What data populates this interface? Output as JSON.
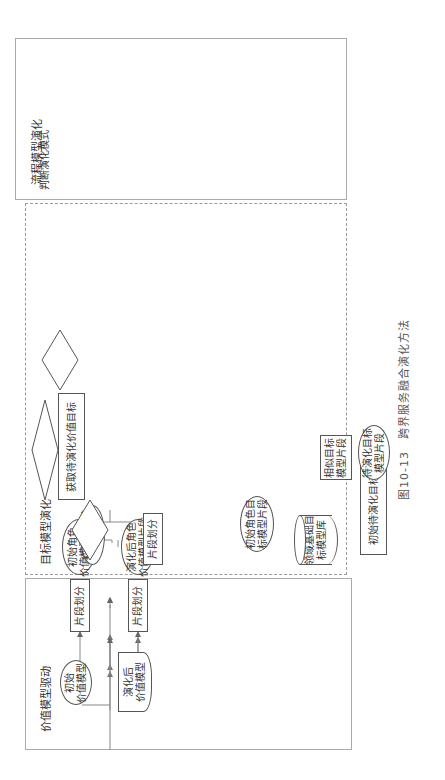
{
  "panels": {
    "value": {
      "title": "价值模型驱动"
    },
    "target": {
      "title": "目标模型演化"
    },
    "process": {
      "title": "流程模型演化"
    }
  },
  "value": {
    "initial_model": "初始\n价值模型",
    "evolved_model": "演化后\n价值模型",
    "split1": "片段划分",
    "split2": "片段划分",
    "initial_fragment": "初始角色\n价值模型片段",
    "evolved_fragment": "演化后角色\n价值模型片段",
    "get_target": "获取待演化价值目标"
  },
  "target": {
    "judge_mode": "判断演化模式",
    "branch_original": "目标属原领域",
    "branch_new": "目标属新领域",
    "species_evo": "种群式演化",
    "community_evo": "群落式演化",
    "judge_role1": "判断有无\n新角色",
    "judge_role2": "判断有无\n新角色",
    "no_label": "无",
    "yes_label": "有",
    "pending_init_role1": "待演化\n初始角色",
    "pending_new_role1": "待演化\n新角色",
    "pending_init_role2": "待演化\n初始角色",
    "pending_new_role2": "待演化\n新角色",
    "initial_target_model": "初始目标模型",
    "split": "片段划分",
    "initial_role_fragment": "初始角色目\n标模型片段",
    "domain_repo": "领域基础目\n标模型库",
    "similar_fragment": "相似目标\n模型片段",
    "initial_pending_target": "初始待演化目标",
    "pending_fragment": "待演化目标\n模型片段",
    "corresponding_op": "相应演化操作",
    "update_deps": "更新依赖关系",
    "evolved_target_model": "演化后目标模型"
  },
  "process": {
    "domain_repo": "领域基础\n流程模型库",
    "initial_model": "初始\n流程模型",
    "split": "片段划分",
    "match": "匹配流程片段",
    "initial_fragment": "初始\n流程模型",
    "pending_fragment": "待演化\n流程片段",
    "evo_op": "演化操作",
    "evolved_model": "演化后流程模型"
  },
  "caption": "图10-13　跨界服务融合演化方法",
  "colors": {
    "line": "#777777",
    "border": "#555555",
    "text": "#333333"
  }
}
